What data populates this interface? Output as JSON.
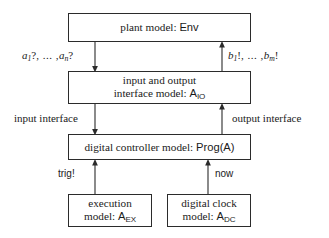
{
  "diagram": {
    "background_color": "#ffffff",
    "line_color": "#2b2b2b",
    "boxes": [
      {
        "id": "plant",
        "line1": "plant model: ",
        "name_sans": "Env",
        "line2": ""
      },
      {
        "id": "io",
        "line1": "input and output",
        "line2": "interface model: ",
        "name_sans": "A",
        "name_sub": "IO"
      },
      {
        "id": "controller",
        "line1": "digital controller model: ",
        "name_sans": "Prog(A)",
        "line2": ""
      },
      {
        "id": "execution",
        "line1": "execution",
        "line2": "model: ",
        "name_sans": "A",
        "name_sub": "EX"
      },
      {
        "id": "clock",
        "line1": "digital clock",
        "line2": "model: ",
        "name_sans": "A",
        "name_sub": "DC"
      }
    ],
    "edge_labels": {
      "inputs_signal": {
        "var": "a",
        "first_index": "1",
        "last_index": "n",
        "op": "?",
        "dots": ", ... ,",
        "full_text": "a1?, ... , an?"
      },
      "outputs_signal": {
        "var": "b",
        "first_index": "1",
        "last_index": "m",
        "op": "!",
        "dots": ", ... ,",
        "full_text": "b1!, ... , bm!"
      },
      "input_interface": "input interface",
      "output_interface": "output interface",
      "trig": "trig!",
      "now": "now"
    }
  }
}
